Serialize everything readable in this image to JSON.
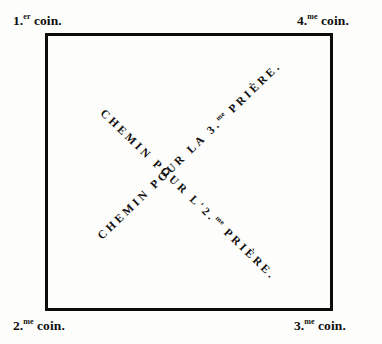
{
  "figure": {
    "type": "ritual-path-diagram",
    "language": "fr"
  },
  "corners": {
    "top_left": {
      "number": "1.",
      "ordinal_suffix": "er",
      "noun": " coin."
    },
    "top_right": {
      "number": "4.",
      "ordinal_suffix": "me",
      "noun": " coin."
    },
    "bottom_left": {
      "number": "2.",
      "ordinal_suffix": "me",
      "noun": " coin."
    },
    "bottom_right": {
      "number": "3.",
      "ordinal_suffix": "me",
      "noun": " coin."
    }
  },
  "paths": {
    "descending": {
      "lead": "CHEMIN POUR L'",
      "number": "2.",
      "ordinal_suffix": "me",
      "tail": " PRIÈRE.",
      "from_corner": "1.er coin.",
      "to_corner": "3.me coin."
    },
    "ascending": {
      "lead": "CHEMIN POUR LA ",
      "number": "3.",
      "ordinal_suffix": "me",
      "tail": " PRIÈRE.",
      "from_corner": "2.me coin.",
      "to_corner": "4.me coin."
    }
  },
  "colors": {
    "ink": "#100f0d",
    "paper": "#fdfdfc",
    "border": "#0d0c0b"
  }
}
